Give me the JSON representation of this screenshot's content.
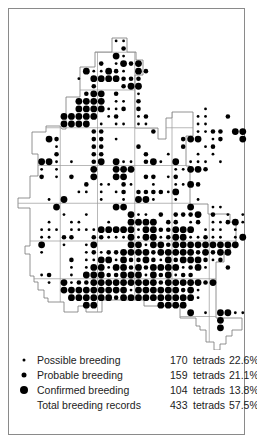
{
  "map": {
    "title": "Breeding distribution map (tetrads)",
    "grid": {
      "origin_x": 23,
      "origin_y": 14.5,
      "pitch_x": 7.45,
      "pitch_y": 7.55,
      "square_size_tetrads": 5
    },
    "colors": {
      "dot": "#000000",
      "outline": "#777777",
      "grid": "#999999",
      "frame": "#8a8a8a"
    },
    "dot_radius": {
      "s": 1.4,
      "m": 2.3,
      "L": 3.4
    },
    "rows": [
      "..............................",
      "..............................",
      "..............................",
      "............ss................",
      ".............m................",
      "............Ls................",
      "..........m.sLmL..............",
      "........LssLms.Lm.............",
      ".......s.LLLLmmm..............",
      ".........m...mLL..............",
      "........mLL.m..s..............",
      ".......LLLL.ss.m..............",
      ".......LLLLssm.m........s.....",
      ".....LLLLL.sm..sm......ss..m..",
      ".....LLLL.s.ss.ss......ss.....",
      ".........mm......m.....ssmm.LL",
      "...Lm....mm.s........mLL.sm..L",
      "....s....mm....m.....m..sm....",
      "....m....mm.....m..s...s.s....",
      "..LLs.s..mL.Lss.mLs.L.sss.s...",
      "..s.s....L..LLL.....ssLLm.....",
      "..m.s.m..L..LL..mm.sm.........",
      "........m.ss.ms..s..ssLm......",
      ".......ss.s.sm.mmmmsL.........",
      "...s.L....s..s.LLs..s..s......",
      "....L.......LL........L..ss...",
      ".....s..s.....Lss.m.mmmL.m.s.s",
      "...s..ss...s..LLLL.mm.sm.ssmLs",
      "..sss.ssssLLLLLsLLmmLLL.sss.s.",
      "..ss.mm..mmsssLsLLsmLLssmss.sL",
      "..L..s..sL....LLsLLmLLLLLLLLL.",
      "..s.....smsmmLLLLmLLLLLmLmLL..",
      "......m.ssLLsLmmLmsLmLLLmsm...",
      "......s.sLLsLLmLmLLLLsmLs..m..",
      "..sm..s.LLLmmLLLsLmLsmm.......",
      "...s.LsmmLLLLLLLLLmLLLLLmL....",
      ".....LLLLLLLLLsLLLLLLmLs......",
      "......LLLLLLmLLLLLLLLLLs......",
      "........LL........LLLL........",
      "......................L.s.LLss",
      "..........................L...",
      "..........................L...",
      "..............................",
      ".............................."
    ],
    "outline": "M62,129 L66,129 L66,97 L80,97 L80,67 L95,67 L95,52 L112,52 L112,38 L127,38 L127,52 L136,52 L136,60 L143,60 L143,75 L135,75 L135,128 L158,128 L158,139 L166,139 L166,118 L172,118 L172,112 L193,112 L193,136 L186,136 L186,166 L190,166 L190,204 L208,204 L208,214 L230,214 L230,222 L236,222 L236,246 L230,246 L230,254 L224,254 L224,262 L216,262 L216,318 L242,318 L242,330 L232,330 L232,336 L226,336 L226,344 L220,344 L220,350 L214,350 L214,342 L206,342 L206,330 L200,330 L200,326 L196,326 L196,318 L180,318 L180,306 L144,306 L144,300 L102,300 L102,312 L86,312 L86,306 L78,306 L78,312 L64,312 L64,302 L48,302 L48,298 L44,298 L44,290 L38,290 L38,282 L34,282 L34,276 L30,276 L30,254 L25,254 L25,246 L30,246 L30,208 L18,208 L18,198 L30,198 L30,176 L38,176 L38,154 L32,154 L32,132 L46,132 L46,126 L60,126 Z"
  },
  "legend": {
    "items": [
      {
        "symbol": "small-dot",
        "label": "Possible breeding",
        "count": "170",
        "unit": "tetrads",
        "percent": "22.6%"
      },
      {
        "symbol": "medium-dot",
        "label": "Probable breeding",
        "count": "159",
        "unit": "tetrads",
        "percent": "21.1%"
      },
      {
        "symbol": "large-dot",
        "label": "Confirmed breeding",
        "count": "104",
        "unit": "tetrads",
        "percent": "13.8%"
      },
      {
        "symbol": "none",
        "label": "Total breeding records",
        "count": "433",
        "unit": "tetrads",
        "percent": "57.5%"
      }
    ]
  }
}
